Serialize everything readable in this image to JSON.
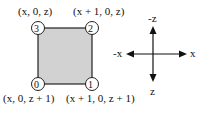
{
  "diagram": {
    "quad": {
      "fill": "#d2d2d2",
      "stroke": "#222222",
      "vertices": [
        {
          "index": "0",
          "label": "(x, 0, z + 1)"
        },
        {
          "index": "1",
          "label": "(x + 1, 0, z + 1)"
        },
        {
          "index": "2",
          "label": "(x + 1, 0, z)"
        },
        {
          "index": "3",
          "label": "(x, 0, z)"
        }
      ]
    },
    "axes": {
      "neg_z": "-z",
      "pos_z": "z",
      "neg_x": "-x",
      "pos_x": "x"
    }
  }
}
